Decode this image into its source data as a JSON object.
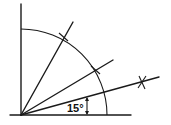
{
  "diagram": {
    "type": "geometric-construction",
    "angle_label": "15°",
    "rays_degrees": [
      15,
      30,
      60
    ],
    "arc_radius_px": 86,
    "colors": {
      "stroke": "#1a1a1a",
      "background": "#ffffff"
    }
  }
}
